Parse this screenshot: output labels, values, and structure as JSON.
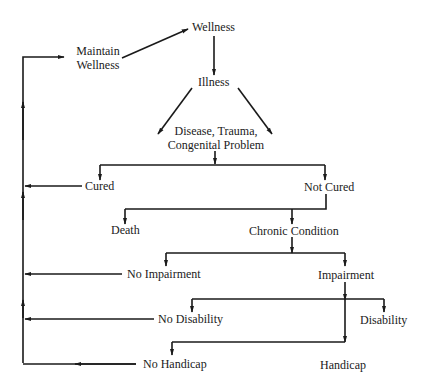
{
  "diagram": {
    "type": "flowchart",
    "title": "",
    "colors": {
      "line": "#1a1a1a",
      "background": "#ffffff",
      "text": "#1a1a1a"
    },
    "nodes": {
      "wellness": "Wellness",
      "maintain_wellness_1": "Maintain",
      "maintain_wellness_2": "Wellness",
      "illness": "Illness",
      "disease_1": "Disease, Trauma,",
      "disease_2": "Congenital Problem",
      "cured": "Cured",
      "not_cured": "Not Cured",
      "death": "Death",
      "chronic_condition": "Chronic Condition",
      "no_impairment": "No Impairment",
      "impairment": "Impairment",
      "no_disability": "No Disability",
      "disability": "Disability",
      "no_handicap": "No Handicap",
      "handicap": "Handicap"
    },
    "edges": [
      [
        "Maintain Wellness",
        "Wellness"
      ],
      [
        "Wellness",
        "Illness"
      ],
      [
        "Illness",
        "Disease, Trauma, Congenital Problem"
      ],
      [
        "Disease, Trauma, Congenital Problem",
        "Cured"
      ],
      [
        "Disease, Trauma, Congenital Problem",
        "Not Cured"
      ],
      [
        "Cured",
        "Maintain Wellness"
      ],
      [
        "Not Cured",
        "Death"
      ],
      [
        "Not Cured",
        "Chronic Condition"
      ],
      [
        "Chronic Condition",
        "No Impairment"
      ],
      [
        "Chronic Condition",
        "Impairment"
      ],
      [
        "No Impairment",
        "Maintain Wellness"
      ],
      [
        "Impairment",
        "No Disability"
      ],
      [
        "Impairment",
        "Disability"
      ],
      [
        "No Disability",
        "Maintain Wellness"
      ],
      [
        "Impairment",
        "No Handicap"
      ],
      [
        "Impairment",
        "Handicap"
      ],
      [
        "No Handicap",
        "Maintain Wellness"
      ]
    ]
  }
}
